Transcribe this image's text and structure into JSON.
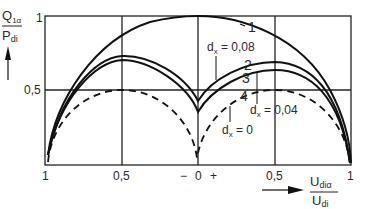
{
  "diagram": {
    "y_axis": {
      "label_num": "Q",
      "label_num_sub": "1α",
      "label_den": "P",
      "label_den_sub": "di",
      "ticks": [
        "1",
        "0,5"
      ]
    },
    "x_axis": {
      "label_num": "U",
      "label_num_sub": "diα",
      "label_den": "U",
      "label_den_sub": "di",
      "ticks": [
        "1",
        "0,5",
        "0",
        "0,5",
        "1"
      ],
      "minus_sign": "−",
      "plus_sign": "+"
    },
    "curves": [
      {
        "id": "1",
        "style": "solid",
        "label": "1"
      },
      {
        "id": "2",
        "style": "solid",
        "label": "2"
      },
      {
        "id": "3",
        "style": "solid",
        "label": "3"
      },
      {
        "id": "4",
        "style": "dashed",
        "label": "4"
      }
    ],
    "annotations": {
      "dx_008": {
        "d": "d",
        "sub": "x",
        "value": " = 0,08"
      },
      "dx_004": {
        "d": "d",
        "sub": "x",
        "value": " = 0,04"
      },
      "dx_0": {
        "d": "d",
        "sub": "x",
        "value": " = 0"
      }
    },
    "colors": {
      "line": "#111111",
      "grid": "#222222",
      "background": "#ffffff"
    }
  }
}
